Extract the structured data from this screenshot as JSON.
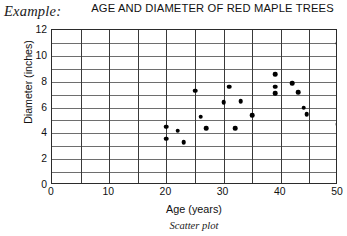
{
  "example_label": "Example:",
  "caption": "Scatter plot",
  "chart_data": {
    "type": "scatter",
    "title": "AGE AND DIAMETER OF RED MAPLE TREES",
    "xlabel": "Age (years)",
    "ylabel": "Diameter (inches)",
    "xlim": [
      0,
      50
    ],
    "ylim": [
      0,
      12
    ],
    "grid": true,
    "x_major_step": 10,
    "x_grid_step": 5,
    "y_major_step": 2,
    "y_grid_step": 1,
    "xticks": [
      0,
      10,
      20,
      30,
      40,
      50
    ],
    "yticks": [
      0,
      2,
      4,
      6,
      8,
      10,
      12
    ],
    "xtick_labels": [
      "0",
      "10",
      "20",
      "30",
      "40",
      "50"
    ],
    "ytick_labels": [
      "0",
      "2",
      "4",
      "6",
      "8",
      "10",
      "12"
    ],
    "legend": null,
    "marker": "filled-circle",
    "marker_color": "#000000",
    "points": [
      {
        "x": 20,
        "y": 4.5
      },
      {
        "x": 20,
        "y": 3.6
      },
      {
        "x": 22,
        "y": 4.2
      },
      {
        "x": 23,
        "y": 3.3
      },
      {
        "x": 25,
        "y": 7.3
      },
      {
        "x": 26,
        "y": 5.3
      },
      {
        "x": 27,
        "y": 4.4
      },
      {
        "x": 30,
        "y": 6.4
      },
      {
        "x": 31,
        "y": 7.6
      },
      {
        "x": 32,
        "y": 4.4
      },
      {
        "x": 33,
        "y": 6.5
      },
      {
        "x": 35,
        "y": 5.4
      },
      {
        "x": 39,
        "y": 8.6
      },
      {
        "x": 39,
        "y": 7.6
      },
      {
        "x": 39,
        "y": 7.1
      },
      {
        "x": 42,
        "y": 7.9
      },
      {
        "x": 43,
        "y": 7.2
      },
      {
        "x": 44,
        "y": 6.0
      },
      {
        "x": 44.5,
        "y": 5.5
      },
      {
        "x": 50,
        "y": 11.0
      },
      {
        "x": 50,
        "y": 4.7
      }
    ]
  }
}
